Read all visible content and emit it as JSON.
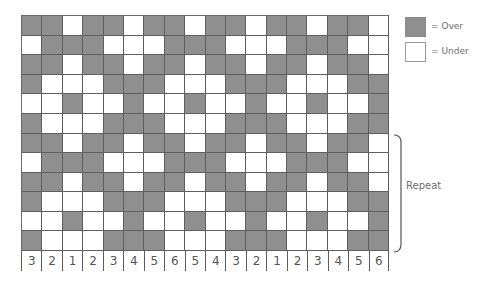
{
  "diagram": {
    "type": "weave-draft",
    "rows": 12,
    "columns": 18,
    "colors": {
      "over": "#8f8f8f",
      "under": "#ffffff",
      "grid_line": "#5e5e5e"
    },
    "pattern_rows": [
      [
        1,
        1,
        0,
        1,
        1,
        0,
        1,
        1,
        0,
        1,
        1,
        0,
        1,
        1,
        0,
        1,
        1,
        0
      ],
      [
        0,
        1,
        1,
        1,
        0,
        0,
        0,
        1,
        1,
        1,
        0,
        0,
        0,
        1,
        1,
        1,
        0,
        0
      ],
      [
        1,
        1,
        0,
        1,
        1,
        0,
        1,
        1,
        0,
        1,
        1,
        0,
        1,
        1,
        0,
        1,
        1,
        0
      ],
      [
        1,
        0,
        0,
        0,
        1,
        1,
        1,
        0,
        0,
        0,
        1,
        1,
        1,
        0,
        0,
        0,
        1,
        1
      ],
      [
        0,
        0,
        1,
        0,
        0,
        1,
        0,
        0,
        1,
        0,
        0,
        1,
        0,
        0,
        1,
        0,
        0,
        1
      ],
      [
        1,
        0,
        0,
        0,
        1,
        1,
        1,
        0,
        0,
        0,
        1,
        1,
        1,
        0,
        0,
        0,
        1,
        1
      ],
      [
        1,
        1,
        0,
        1,
        1,
        0,
        1,
        1,
        0,
        1,
        1,
        0,
        1,
        1,
        0,
        1,
        1,
        0
      ],
      [
        0,
        1,
        1,
        1,
        0,
        0,
        0,
        1,
        1,
        1,
        0,
        0,
        0,
        1,
        1,
        1,
        0,
        0
      ],
      [
        1,
        1,
        0,
        1,
        1,
        0,
        1,
        1,
        0,
        1,
        1,
        0,
        1,
        1,
        0,
        1,
        1,
        0
      ],
      [
        1,
        0,
        0,
        0,
        1,
        1,
        1,
        0,
        0,
        0,
        1,
        1,
        1,
        0,
        0,
        0,
        1,
        1
      ],
      [
        0,
        0,
        1,
        0,
        0,
        1,
        0,
        0,
        1,
        0,
        0,
        1,
        0,
        0,
        1,
        0,
        0,
        1
      ],
      [
        1,
        0,
        0,
        0,
        1,
        1,
        1,
        0,
        0,
        0,
        1,
        1,
        1,
        0,
        0,
        0,
        1,
        1
      ]
    ],
    "column_labels": [
      "3",
      "2",
      "1",
      "2",
      "3",
      "4",
      "5",
      "6",
      "5",
      "4",
      "3",
      "2",
      "1",
      "2",
      "3",
      "4",
      "5",
      "6"
    ]
  },
  "legend": {
    "over_label": "= Over",
    "under_label": "= Under"
  },
  "repeat": {
    "label": "Repeat",
    "rows_spanned": [
      6,
      11
    ]
  }
}
